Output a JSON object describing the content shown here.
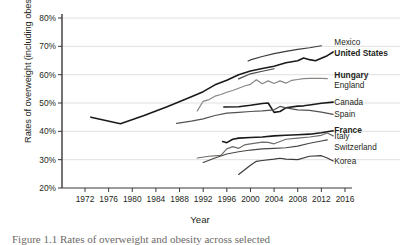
{
  "figure": {
    "caption": "Figure 1.1  Rates of overweight and obesity across selected"
  },
  "chart_data": {
    "type": "line",
    "title": "",
    "xlabel": "Year",
    "ylabel": "Rates of overweight (including obesity)",
    "xlim": [
      1972,
      2016
    ],
    "ylim": [
      20,
      80
    ],
    "xticks": [
      1972,
      1976,
      1980,
      1984,
      1988,
      1992,
      1996,
      2000,
      2004,
      2008,
      2012,
      2016
    ],
    "yticks": [
      "20%",
      "30%",
      "40%",
      "50%",
      "60%",
      "70%",
      "80%"
    ],
    "grid": "horizontal",
    "legend_position": "right-inline-labels",
    "series": [
      {
        "name": "Mexico",
        "label": "Mexico",
        "bold": false,
        "color": "#3d3a38",
        "label_x": 2014.2,
        "label_y": 71.6,
        "points": [
          [
            1999.6,
            64.8
          ],
          [
            2000,
            65.2
          ],
          [
            2002,
            66.4
          ],
          [
            2004,
            67.4
          ],
          [
            2006,
            68.2
          ],
          [
            2008,
            68.9
          ],
          [
            2010,
            69.5
          ],
          [
            2012,
            70.2
          ]
        ]
      },
      {
        "name": "United States",
        "label": "United States",
        "bold": true,
        "color": "#1a1a1a",
        "label_x": 2014.2,
        "label_y": 67.6,
        "points": [
          [
            1973,
            45.0
          ],
          [
            1978,
            42.7
          ],
          [
            1982,
            45.6
          ],
          [
            1986,
            48.8
          ],
          [
            1990,
            52.2
          ],
          [
            1992,
            54.0
          ],
          [
            1994,
            56.4
          ],
          [
            1996,
            58.0
          ],
          [
            1998,
            60.0
          ],
          [
            2000,
            61.3
          ],
          [
            2002,
            62.2
          ],
          [
            2004,
            63.0
          ],
          [
            2006,
            64.2
          ],
          [
            2008,
            64.9
          ],
          [
            2009,
            65.9
          ],
          [
            2010,
            65.3
          ],
          [
            2011,
            64.9
          ],
          [
            2013,
            66.7
          ],
          [
            2014,
            68.0
          ]
        ]
      },
      {
        "name": "Hungary",
        "label": "Hungary",
        "bold": true,
        "color": "#1a1a1a",
        "label_x": 2014.2,
        "label_y": 59.8,
        "points": [
          [
            1995.5,
            48.6
          ],
          [
            1998,
            48.7
          ],
          [
            2000,
            49.2
          ],
          [
            2002,
            49.8
          ],
          [
            2003,
            50.0
          ],
          [
            2004,
            46.7
          ],
          [
            2005,
            47.0
          ],
          [
            2006,
            48.3
          ],
          [
            2008,
            48.9
          ],
          [
            2009,
            49.0
          ],
          [
            2010,
            49.3
          ],
          [
            2012,
            49.9
          ],
          [
            2014,
            50.3
          ]
        ]
      },
      {
        "name": "England",
        "label": "England",
        "bold": false,
        "color": "#8a8684",
        "label_x": 2014.2,
        "label_y": 56.4,
        "points": [
          [
            1991,
            47.2
          ],
          [
            1992,
            50.6
          ],
          [
            1993,
            51.2
          ],
          [
            1994,
            52.4
          ],
          [
            1995,
            53.0
          ],
          [
            1996,
            53.8
          ],
          [
            1997,
            54.4
          ],
          [
            1998,
            55.2
          ],
          [
            1999,
            56.0
          ],
          [
            2000,
            56.6
          ],
          [
            2001,
            58.2
          ],
          [
            2002,
            56.8
          ],
          [
            2003,
            57.8
          ],
          [
            2004,
            56.9
          ],
          [
            2005,
            57.8
          ],
          [
            2006,
            57.0
          ],
          [
            2007,
            58.0
          ],
          [
            2008,
            58.3
          ],
          [
            2009,
            58.6
          ],
          [
            2010,
            58.7
          ],
          [
            2012,
            58.7
          ],
          [
            2013,
            58.6
          ]
        ]
      },
      {
        "name": "Canada",
        "label": "Canada",
        "bold": false,
        "color": "#55514f",
        "label_x": 2014.2,
        "label_y": 50.2,
        "points": [
          [
            1987.5,
            42.8
          ],
          [
            1990,
            43.6
          ],
          [
            1992,
            44.4
          ],
          [
            1994,
            45.6
          ],
          [
            1996,
            46.4
          ],
          [
            1998,
            46.7
          ],
          [
            2000,
            47.0
          ],
          [
            2002,
            47.2
          ],
          [
            2004,
            47.6
          ],
          [
            2005,
            48.8
          ],
          [
            2006,
            48.3
          ],
          [
            2008,
            47.6
          ],
          [
            2010,
            47.4
          ],
          [
            2012,
            46.8
          ],
          [
            2014,
            46.0
          ]
        ]
      },
      {
        "name": "Spain",
        "label": "Spain",
        "bold": false,
        "color": "#4a4745",
        "label_x": 2014.2,
        "label_y": 46.0,
        "points": [
          [
            1998.0,
            58.5
          ],
          [
            2000,
            60.3
          ],
          [
            2002,
            61.2
          ],
          [
            2004,
            62.1
          ]
        ]
      },
      {
        "name": "France",
        "label": "France",
        "bold": true,
        "color": "#1a1a1a",
        "label_x": 2014.2,
        "label_y": 40.4,
        "points": [
          [
            1995.3,
            36.4
          ],
          [
            1996,
            36.0
          ],
          [
            1997,
            37.2
          ],
          [
            1998,
            37.6
          ],
          [
            2000,
            37.8
          ],
          [
            2002,
            38.0
          ],
          [
            2004,
            38.4
          ],
          [
            2006,
            38.6
          ],
          [
            2008,
            38.8
          ],
          [
            2010,
            39.0
          ],
          [
            2012,
            39.5
          ],
          [
            2014,
            40.2
          ]
        ]
      },
      {
        "name": "Italy",
        "label": "Italy",
        "bold": false,
        "color": "#6e6a68",
        "label_x": 2014.2,
        "label_y": 38.2,
        "points": [
          [
            1991.0,
            30.6
          ],
          [
            1993,
            31.2
          ],
          [
            1995,
            31.5
          ],
          [
            1996,
            33.8
          ],
          [
            1997,
            34.6
          ],
          [
            1998,
            34.0
          ],
          [
            1999,
            35.2
          ],
          [
            2000,
            35.6
          ],
          [
            2002,
            36.2
          ],
          [
            2003,
            36.1
          ],
          [
            2004,
            35.6
          ],
          [
            2006,
            37.2
          ],
          [
            2008,
            37.6
          ],
          [
            2010,
            38.0
          ],
          [
            2012,
            38.6
          ],
          [
            2013,
            39.4
          ],
          [
            2014,
            38.4
          ]
        ]
      },
      {
        "name": "Switzerland",
        "label": "Switzerland",
        "bold": false,
        "color": "#4a4745",
        "label_x": 2014.2,
        "label_y": 34.6,
        "points": [
          [
            1992,
            29.0
          ],
          [
            1994,
            30.6
          ],
          [
            1996,
            32.0
          ],
          [
            1998,
            32.8
          ],
          [
            2000,
            33.4
          ],
          [
            2002,
            33.8
          ],
          [
            2004,
            34.0
          ],
          [
            2006,
            34.2
          ],
          [
            2008,
            34.8
          ],
          [
            2010,
            35.8
          ],
          [
            2012,
            36.6
          ],
          [
            2013,
            37.0
          ]
        ]
      },
      {
        "name": "Korea",
        "label": "Korea",
        "bold": false,
        "color": "#3d3a38",
        "label_x": 2014.2,
        "label_y": 29.6,
        "points": [
          [
            1998,
            24.8
          ],
          [
            2000,
            28.0
          ],
          [
            2001,
            29.4
          ],
          [
            2002,
            29.7
          ],
          [
            2004,
            30.2
          ],
          [
            2005,
            30.5
          ],
          [
            2006,
            30.2
          ],
          [
            2008,
            30.0
          ],
          [
            2010,
            31.2
          ],
          [
            2012,
            31.4
          ],
          [
            2013,
            30.6
          ],
          [
            2014,
            29.5
          ]
        ]
      }
    ]
  }
}
